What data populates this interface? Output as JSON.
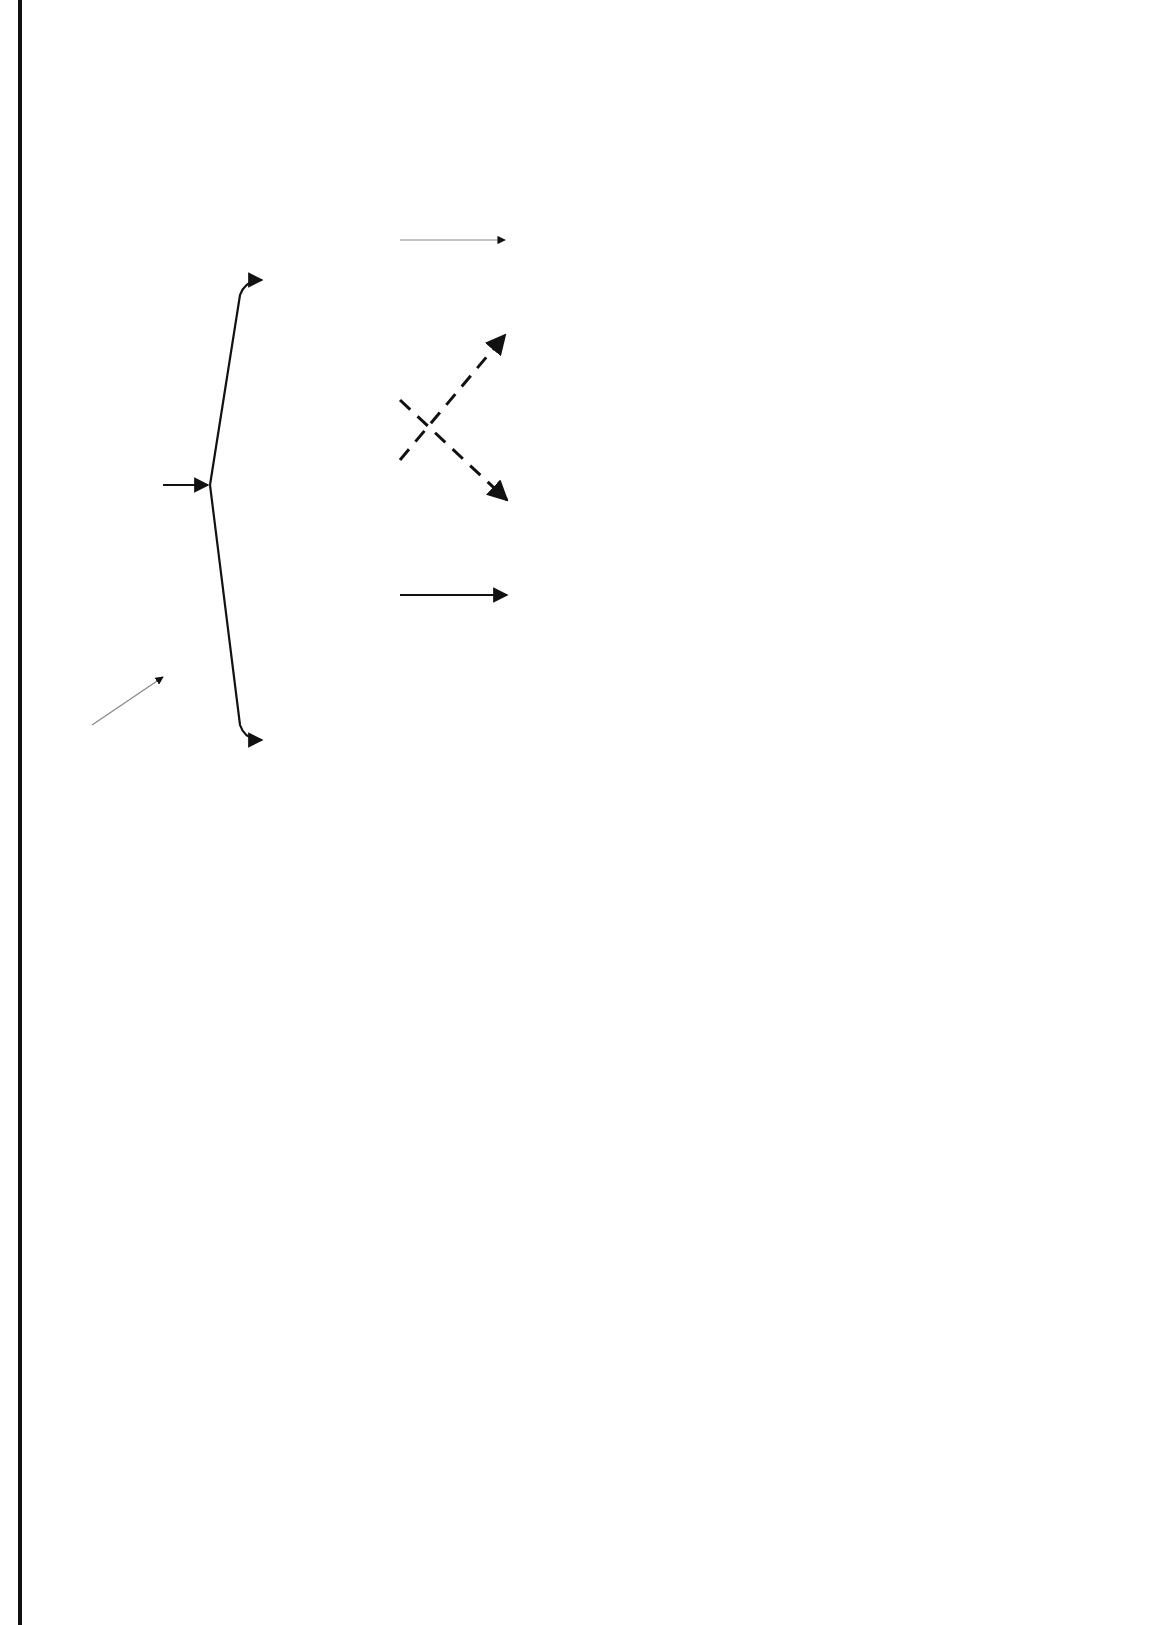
{
  "page": {
    "rule_fragments": [
      "II",
      "g"
    ]
  },
  "root": {
    "label_line1": "Myalgia/",
    "label_line2": "CPK*"
  },
  "asymptomatic": {
    "label": "Asymptomatic",
    "branches": [
      {
        "title": "CPK >3x ULN",
        "items": [
          "Stop all cholesterol lowering medications",
          "Recheck within 7 days"
        ]
      },
      {
        "title": "CPK >1x ULN  and ≤3x ULN",
        "items": [
          "Continue cholesterol lowering medications",
          "Recheck within 4 weeks"
        ]
      }
    ],
    "outcomes": [
      {
        "title": "If CPK > 3x ULN",
        "item1": "Stop cholesterol lowering medications",
        "connector1": "AND",
        "item2": "Consult with PCP or medical director regarding continuation of therapy",
        "connector2": "OR",
        "item3": "Consider re-challenge with mono-therapy"
      },
      {
        "title": "If CPK still < 3x ULN",
        "item1": "Continue cholesterol lowering medications",
        "connector1": "AND",
        "item2": "Consult PCP or medical director regarding continuation of therapy"
      }
    ],
    "stray_mark": "`"
  },
  "symptomatic": {
    "title": "Symptomatic",
    "action": "STOP MEDICATION(s)",
    "lines": [
      "-Identify other sources of muscle pain**",
      "-Check CPK within 7 days"
    ],
    "outcomes": [
      {
        "title": "CPK > ULN",
        "item1": "Consider trial of different cholesterol lowering medication or re-challenge",
        "connector": "OR",
        "item2": "Consult PCP or medical director"
      },
      {
        "title": "CPK Normal",
        "items": [
          "Follow-up with patient regarding symptoms",
          "Consider trial of different cholesterol lowering medication or re-challenge",
          "Consult with PCP or medical director"
        ]
      }
    ]
  },
  "cpk_checked": {
    "title": "*CPK checked:",
    "items": [
      "If patient complaining of muscle aches , weakness or fatigue as directed below .",
      "2  and/or 6-8 weeks following initiation of combination therapy with interacting medication for any statin dose as defined in Appendix G‡"
    ]
  },
  "interacting_medications": {
    "heading": "Interacting Medications",
    "subheading": "‡CPK ordered by CPCRS:",
    "columns": [
      [
        "Cyclosporine",
        "Erythyomycin",
        "Amiodarone",
        "Fenofibrate",
        "Cimetidine",
        "Danazol"
      ],
      [
        "Protease Inhibitors",
        "Clarithromycin",
        "Grapefruit Juice  (>1qt)",
        "Diltiazem",
        "Niacin"
      ],
      [
        "Azole Antifungals",
        "Nefazodone",
        "Gemfibrozil",
        "Verapamil",
        "Risperidone"
      ]
    ]
  },
  "other_sources": {
    "title": "**Other sources of muscle pain :",
    "columns": [
      [
        "extreme exertion",
        "seizures",
        "drugs/toxins"
      ],
      [
        "trauma",
        "arthritis",
        "infections"
      ],
      [
        "immobilization",
        "electrolyte abnormalities",
        "elevated TSH"
      ]
    ]
  }
}
